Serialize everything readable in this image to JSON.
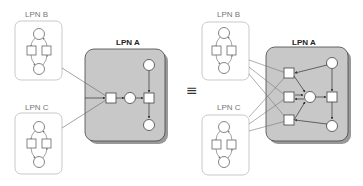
{
  "diagram": {
    "left": {
      "lpn_b_label": "LPN B",
      "lpn_c_label": "LPN C",
      "lpn_a_label": "LPN A"
    },
    "equivalence_symbol": "≡",
    "right": {
      "lpn_b_label": "LPN B",
      "lpn_c_label": "LPN C",
      "lpn_a_label": "LPN A"
    },
    "colors": {
      "lpn_a_fill": "#c8c8c8",
      "lpn_a_stroke": "#444444",
      "sub_box_stroke": "#bbbbbb",
      "shadow": "#999999"
    }
  }
}
